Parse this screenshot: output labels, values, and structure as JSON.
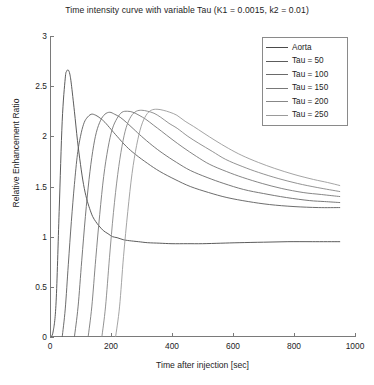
{
  "chart_data": {
    "type": "line",
    "title": "Time intensity curve with variable Tau (K1 = 0.0015, k2 = 0.01)",
    "xlabel": "Time after injection [sec]",
    "ylabel": "Relative Enhancement Ratio",
    "xlim": [
      0,
      1000
    ],
    "ylim": [
      0,
      3
    ],
    "xticks": [
      0,
      200,
      400,
      600,
      800,
      1000
    ],
    "xtick_labels": [
      "0",
      "200",
      "400",
      "600",
      "800",
      "1000"
    ],
    "yticks": [
      0,
      0.5,
      1,
      1.5,
      2,
      2.5,
      3
    ],
    "ytick_labels": [
      "0",
      "0.5",
      "1",
      "1.5",
      "2",
      "2.5",
      "3"
    ],
    "grid": false,
    "legend_position": "upper right",
    "legend_entries": [
      "Aorta",
      "Tau = 50",
      "Tau = 100",
      "Tau = 150",
      "Tau = 200",
      "Tau = 250"
    ],
    "series": [
      {
        "name": "Aorta",
        "color": "#4a4a4a",
        "x": [
          0,
          10,
          20,
          30,
          40,
          50,
          55,
          60,
          65,
          70,
          80,
          90,
          100,
          110,
          120,
          130,
          140,
          150,
          160,
          175,
          190,
          205,
          220,
          240,
          260,
          290,
          320,
          360,
          400,
          450,
          500,
          560,
          620,
          700,
          780,
          860,
          950
        ],
        "y": [
          0,
          0.05,
          0.35,
          1.25,
          2.15,
          2.58,
          2.65,
          2.66,
          2.62,
          2.52,
          2.25,
          1.96,
          1.72,
          1.52,
          1.38,
          1.28,
          1.2,
          1.15,
          1.11,
          1.06,
          1.03,
          1.0,
          0.99,
          0.97,
          0.96,
          0.95,
          0.94,
          0.935,
          0.93,
          0.93,
          0.93,
          0.935,
          0.94,
          0.945,
          0.95,
          0.95,
          0.95
        ]
      },
      {
        "name": "Tau = 50",
        "color": "#5c5c5c",
        "x": [
          40,
          50,
          60,
          70,
          80,
          90,
          100,
          110,
          120,
          135,
          150,
          165,
          180,
          200,
          220,
          250,
          280,
          320,
          360,
          410,
          460,
          520,
          580,
          650,
          720,
          800,
          880,
          950
        ],
        "y": [
          0,
          0.28,
          0.72,
          1.15,
          1.52,
          1.82,
          2.0,
          2.12,
          2.18,
          2.22,
          2.21,
          2.18,
          2.14,
          2.07,
          2.0,
          1.9,
          1.82,
          1.73,
          1.65,
          1.57,
          1.5,
          1.44,
          1.39,
          1.35,
          1.32,
          1.3,
          1.29,
          1.29
        ]
      },
      {
        "name": "Tau = 100",
        "color": "#6a6a6a",
        "x": [
          80,
          92,
          104,
          116,
          128,
          140,
          152,
          166,
          180,
          196,
          212,
          230,
          250,
          275,
          300,
          335,
          370,
          415,
          460,
          515,
          570,
          635,
          700,
          775,
          850,
          900,
          950
        ],
        "y": [
          0,
          0.3,
          0.76,
          1.2,
          1.57,
          1.85,
          2.04,
          2.16,
          2.22,
          2.24,
          2.22,
          2.19,
          2.14,
          2.07,
          2.0,
          1.91,
          1.83,
          1.74,
          1.66,
          1.59,
          1.53,
          1.47,
          1.43,
          1.39,
          1.36,
          1.35,
          1.34
        ]
      },
      {
        "name": "Tau = 150",
        "color": "#787878",
        "x": [
          125,
          137,
          150,
          163,
          176,
          190,
          204,
          220,
          236,
          254,
          272,
          292,
          314,
          340,
          366,
          400,
          436,
          480,
          524,
          578,
          632,
          696,
          760,
          830,
          890,
          950
        ],
        "y": [
          0,
          0.3,
          0.78,
          1.22,
          1.6,
          1.88,
          2.07,
          2.18,
          2.24,
          2.25,
          2.24,
          2.21,
          2.17,
          2.11,
          2.05,
          1.97,
          1.89,
          1.8,
          1.72,
          1.65,
          1.59,
          1.53,
          1.48,
          1.44,
          1.42,
          1.4
        ]
      },
      {
        "name": "Tau = 200",
        "color": "#878787",
        "x": [
          170,
          182,
          195,
          208,
          222,
          236,
          250,
          266,
          283,
          301,
          320,
          341,
          363,
          390,
          417,
          452,
          488,
          532,
          576,
          630,
          684,
          748,
          812,
          876,
          950
        ],
        "y": [
          0,
          0.3,
          0.79,
          1.24,
          1.62,
          1.9,
          2.09,
          2.2,
          2.25,
          2.26,
          2.25,
          2.23,
          2.19,
          2.13,
          2.08,
          2.0,
          1.93,
          1.85,
          1.77,
          1.7,
          1.64,
          1.58,
          1.53,
          1.49,
          1.45
        ]
      },
      {
        "name": "Tau = 250",
        "color": "#9a9a9a",
        "x": [
          215,
          228,
          241,
          255,
          269,
          284,
          299,
          315,
          332,
          351,
          371,
          393,
          416,
          443,
          470,
          505,
          541,
          585,
          629,
          683,
          737,
          800,
          864,
          910,
          950
        ],
        "y": [
          0,
          0.3,
          0.8,
          1.25,
          1.63,
          1.91,
          2.1,
          2.21,
          2.26,
          2.27,
          2.26,
          2.24,
          2.21,
          2.15,
          2.1,
          2.03,
          1.96,
          1.88,
          1.81,
          1.74,
          1.68,
          1.62,
          1.57,
          1.54,
          1.51
        ]
      }
    ]
  }
}
